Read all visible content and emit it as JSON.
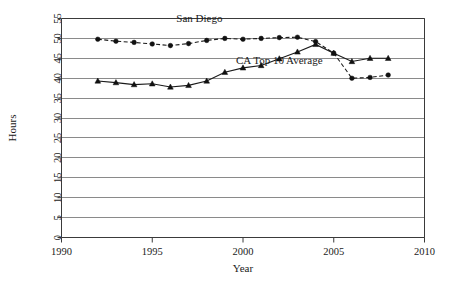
{
  "chart_data": {
    "type": "line",
    "title": "",
    "xlabel": "Year",
    "ylabel": "Hours",
    "xlim": [
      1990,
      2010
    ],
    "ylim": [
      0,
      55
    ],
    "xticks": [
      1990,
      1995,
      2000,
      2005,
      2010
    ],
    "yticks": [
      0,
      5,
      10,
      15,
      20,
      25,
      30,
      35,
      40,
      45,
      50,
      55
    ],
    "grid": "horizontal",
    "legend": "inline-annotations",
    "x": [
      1992,
      1993,
      1994,
      1995,
      1996,
      1997,
      1998,
      1999,
      2000,
      2001,
      2002,
      2003,
      2004,
      2005,
      2006,
      2007,
      2008
    ],
    "series": [
      {
        "name": "San Diego",
        "marker": "circle",
        "linestyle": "dashed",
        "values": [
          49.8,
          49.3,
          49.0,
          48.6,
          48.2,
          48.7,
          49.5,
          50.0,
          49.8,
          50.0,
          50.2,
          50.3,
          49.2,
          46.3,
          40.0,
          40.2,
          40.8
        ]
      },
      {
        "name": "CA Top 10 Average",
        "marker": "triangle",
        "linestyle": "solid",
        "values": [
          39.3,
          38.9,
          38.4,
          38.6,
          37.8,
          38.2,
          39.3,
          41.5,
          42.6,
          43.2,
          44.9,
          46.6,
          48.5,
          46.3,
          44.2,
          45.0,
          45.0
        ]
      }
    ],
    "annotations": [
      {
        "text": "San Diego",
        "x": 1997.6,
        "y": 54.2
      },
      {
        "text": "CA Top 10 Average",
        "x": 2002.0,
        "y": 43.5
      }
    ]
  },
  "axes": {
    "ylabel": "Hours",
    "xlabel": "Year",
    "ytick_labels": [
      "0",
      "5",
      "10",
      "15",
      "20",
      "25",
      "30",
      "35",
      "40",
      "45",
      "50",
      "55"
    ],
    "xtick_labels": [
      "1990",
      "1995",
      "2000",
      "2005",
      "2010"
    ]
  },
  "annotations": {
    "san_diego": "San Diego",
    "ca_top_10": "CA Top 10 Average"
  },
  "colors": {
    "line": "#1a1a1a",
    "grid": "#8a8a8a",
    "axis": "#3a3a3a",
    "background": "#ffffff"
  },
  "footer": {
    "clipped_caption": ""
  }
}
